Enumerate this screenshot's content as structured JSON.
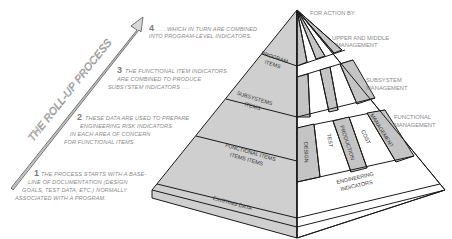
{
  "diagram": {
    "arrow_label": "THE ROLL-UP PROCESS",
    "steps": [
      {
        "number": "1",
        "lines": [
          "THE PROCESS STARTS WITH A BASE-",
          "LINE OF DOCUMENTATION (DESIGN",
          "GOALS, TEST DATA, ETC.) NORMALLY",
          "ASSOCIATED WITH A PROGRAM."
        ]
      },
      {
        "number": "2",
        "lines": [
          "THESE DATA ARE USED TO PREPARE",
          "ENGINEERING RISK INDICATORS",
          "IN EACH AREA OF CONCERN",
          "FOR FUNCTIONAL ITEMS."
        ]
      },
      {
        "number": "3",
        "lines": [
          "THE FUNCTIONAL ITEM INDICATORS",
          "ARE COMBINED TO PRODUCE",
          "SUBSYSTEM INDICATORS . . ."
        ]
      },
      {
        "number": "4",
        "lines": [
          ". . . WHICH IN TURN ARE COMBINED",
          "INTO PROGRAM-LEVEL INDICATORS."
        ]
      }
    ],
    "pyramid_left_face": {
      "tiers": [
        {
          "lines": [
            "PROGRAM",
            "ITEMS"
          ]
        },
        {
          "lines": [
            "SUBSYSTEMS",
            "ITEMS"
          ]
        },
        {
          "lines": [
            "FUNCTIONAL ITEMS",
            "ITEMS ITEMS"
          ]
        },
        {
          "lines": [
            "EXISTING DATA"
          ]
        }
      ]
    },
    "pyramid_right_face": {
      "risk_areas": [
        "DESIGN",
        "TEST",
        "PRODUCTION",
        "COST",
        "MANAGEMENT"
      ],
      "base_label": [
        "ENGINEERING",
        "INDICATORS"
      ]
    },
    "action_header": "FOR ACTION BY:",
    "action_levels": [
      {
        "lines": [
          "UPPER AND MIDDLE",
          "MANAGEMENT"
        ]
      },
      {
        "lines": [
          "SUBSYSTEM",
          "MANAGEMENT"
        ]
      },
      {
        "lines": [
          "FUNCTIONAL",
          "MANAGEMENT"
        ]
      }
    ],
    "colors": {
      "left_face": "#cfcfcf",
      "shaded_stripe": "#c4c4c4",
      "white_stripe": "#ffffff",
      "outline": "#1a1a1a",
      "caption_text": "#8a8a8a"
    }
  }
}
